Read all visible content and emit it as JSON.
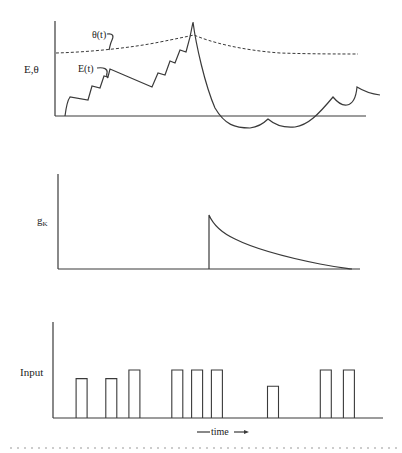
{
  "panels": {
    "top": {
      "ylabel": "E,θ",
      "theta_label": "θ(t)",
      "E_label": "E(t)"
    },
    "middle": {
      "ylabel_main": "g",
      "ylabel_sub": "K"
    },
    "bottom": {
      "ylabel": "Input",
      "xlabel": "time",
      "arrow_glyph": "→",
      "pulses": [
        {
          "t": 0.07,
          "height": 0.82
        },
        {
          "t": 0.16,
          "height": 0.82
        },
        {
          "t": 0.23,
          "height": 1.0
        },
        {
          "t": 0.36,
          "height": 1.0
        },
        {
          "t": 0.42,
          "height": 1.0
        },
        {
          "t": 0.48,
          "height": 1.0
        },
        {
          "t": 0.65,
          "height": 0.66
        },
        {
          "t": 0.81,
          "height": 1.0
        },
        {
          "t": 0.88,
          "height": 1.0
        }
      ]
    }
  }
}
